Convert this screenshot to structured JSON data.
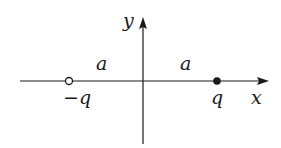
{
  "diagram": {
    "axes": {
      "x_label": "x",
      "y_label": "y"
    },
    "charges": [
      {
        "label": "−q",
        "kind": "negative",
        "marker": "open-circle"
      },
      {
        "label": "q",
        "kind": "positive",
        "marker": "filled-dot"
      }
    ],
    "distances": [
      {
        "label": "a"
      },
      {
        "label": "a"
      }
    ],
    "colors": {
      "stroke": "#1a1a1a",
      "background": "#ffffff"
    }
  }
}
